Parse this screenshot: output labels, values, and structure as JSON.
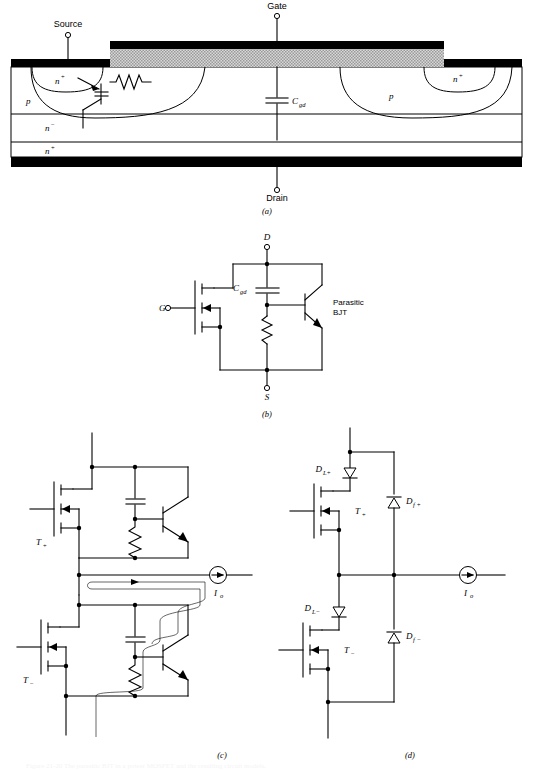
{
  "figure": {
    "caption": "Figure 21-20  The parasitic BJT in a power MOSFET and the resulting circuit models.",
    "panels": [
      {
        "id": "a",
        "letter": "(a)",
        "title": "MOSFET cross-section with parasitic BJT"
      },
      {
        "id": "b",
        "letter": "(b)",
        "title": "Equivalent circuit model"
      },
      {
        "id": "c",
        "letter": "(c)",
        "title": "Half-bridge with parasitic BJT conduction path"
      },
      {
        "id": "d",
        "letter": "(d)",
        "title": "Half-bridge with series and freewheeling diodes"
      }
    ]
  },
  "panel_a": {
    "letter": "(a)",
    "terminals": {
      "source": "Source",
      "gate": "Gate",
      "drain": "Drain"
    },
    "region_labels": {
      "n_plus_left": "n",
      "n_plus_left_sup": "+",
      "p_left": "p",
      "n_minus": "n",
      "n_minus_sup": "−",
      "n_plus_substrate": "n",
      "n_plus_substrate_sup": "+",
      "p_right": "p",
      "n_plus_right": "n",
      "n_plus_right_sup": "+"
    },
    "capacitor_label": "C",
    "capacitor_sub": "gd",
    "colors": {
      "metal": "#000000",
      "oxide": "#cfcfcf",
      "silicon": "#ffffff",
      "line": "#000000"
    }
  },
  "panel_b": {
    "letter": "(b)",
    "terminals": {
      "drain": "D",
      "gate": "G",
      "source": "S"
    },
    "capacitor_label": "C",
    "capacitor_sub": "gd",
    "annotation_line1": "Parasitic",
    "annotation_line2": "BJT"
  },
  "panel_c": {
    "letter": "(c)",
    "devices": {
      "upper_mosfet": "T",
      "upper_mosfet_sub": "+",
      "lower_mosfet": "T",
      "lower_mosfet_sub": "−"
    },
    "current_source": {
      "label": "I",
      "sub": "o"
    }
  },
  "panel_d": {
    "letter": "(d)",
    "devices": {
      "upper_mosfet": "T",
      "upper_mosfet_sub": "+",
      "lower_mosfet": "T",
      "lower_mosfet_sub": "−"
    },
    "diodes": {
      "series_upper": "D",
      "series_upper_sub": "L+",
      "series_lower": "D",
      "series_lower_sub": "L−",
      "free_upper": "D",
      "free_upper_sub": "f +",
      "free_lower": "D",
      "free_lower_sub": "f −"
    },
    "current_source": {
      "label": "I",
      "sub": "o"
    }
  }
}
